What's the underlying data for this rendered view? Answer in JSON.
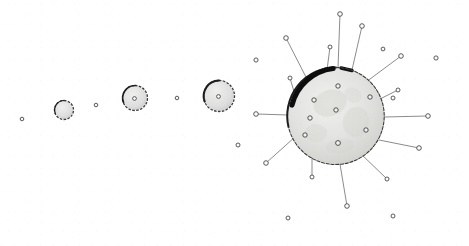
{
  "figure": {
    "background_color": "#ffffff",
    "width": 469,
    "height": 246,
    "ink_color": "#3a3a3a",
    "limb_shadow_color": "#121212",
    "body_fill_color": "#e4e4e2",
    "mare_color": "#cfcfcb",
    "callout_line_color": "#6e6e6e",
    "marker_stroke_color": "#4a4a4a"
  },
  "spheres": [
    {
      "name": "sphere-1",
      "cx": 64,
      "cy": 110,
      "r": 9.5,
      "outline_weight": 1.3,
      "label": "stage 1"
    },
    {
      "name": "sphere-2",
      "cx": 135,
      "cy": 98,
      "r": 12.5,
      "outline_weight": 1.3,
      "label": "stage 2"
    },
    {
      "name": "sphere-3",
      "cx": 219,
      "cy": 96,
      "r": 15.5,
      "outline_weight": 1.3,
      "label": "stage 3"
    },
    {
      "name": "sphere-4",
      "cx": 336,
      "cy": 116,
      "r": 49,
      "outline_weight": 1.6,
      "label": "stage 4"
    }
  ],
  "field_dots": [
    {
      "name": "field-dot-1",
      "cx": 22,
      "cy": 119,
      "r": 1.8
    },
    {
      "name": "field-dot-2",
      "cx": 96,
      "cy": 105,
      "r": 1.8
    },
    {
      "name": "field-dot-3",
      "cx": 177,
      "cy": 98,
      "r": 1.8
    }
  ],
  "surface_markers": [
    {
      "name": "surface-marker-1",
      "cx": 338,
      "cy": 86,
      "r": 2.2
    },
    {
      "name": "surface-marker-2",
      "cx": 370,
      "cy": 97,
      "r": 2.2
    },
    {
      "name": "surface-marker-3",
      "cx": 314,
      "cy": 100,
      "r": 2.2
    },
    {
      "name": "surface-marker-4",
      "cx": 336,
      "cy": 110,
      "r": 2.2
    },
    {
      "name": "surface-marker-5",
      "cx": 310,
      "cy": 118,
      "r": 2.2
    },
    {
      "name": "surface-marker-6",
      "cx": 366,
      "cy": 130,
      "r": 2.2
    },
    {
      "name": "surface-marker-7",
      "cx": 305,
      "cy": 135,
      "r": 2.2
    },
    {
      "name": "surface-marker-8",
      "cx": 338,
      "cy": 143,
      "r": 2.4
    }
  ],
  "callouts": [
    {
      "name": "callout-n",
      "x1": 338,
      "y1": 68,
      "x2": 340,
      "y2": 14,
      "mr": 2.3
    },
    {
      "name": "callout-nne",
      "x1": 352,
      "y1": 70,
      "x2": 362,
      "y2": 26,
      "mr": 2.3
    },
    {
      "name": "callout-nnw",
      "x1": 327,
      "y1": 70,
      "x2": 330,
      "y2": 47,
      "mr": 2.0
    },
    {
      "name": "callout-nw",
      "x1": 308,
      "y1": 81,
      "x2": 286,
      "y2": 38,
      "mr": 2.3
    },
    {
      "name": "callout-wnw",
      "x1": 295,
      "y1": 95,
      "x2": 290,
      "y2": 78,
      "mr": 2.0
    },
    {
      "name": "callout-w",
      "x1": 288,
      "y1": 115,
      "x2": 256,
      "y2": 114,
      "mr": 2.3
    },
    {
      "name": "callout-wsw",
      "x1": 295,
      "y1": 137,
      "x2": 266,
      "y2": 163,
      "mr": 2.3
    },
    {
      "name": "callout-sw",
      "x1": 312,
      "y1": 152,
      "x2": 312,
      "y2": 177,
      "mr": 2.0
    },
    {
      "name": "callout-s",
      "x1": 340,
      "y1": 164,
      "x2": 347,
      "y2": 206,
      "mr": 2.3
    },
    {
      "name": "callout-sse",
      "x1": 360,
      "y1": 153,
      "x2": 387,
      "y2": 179,
      "mr": 2.0
    },
    {
      "name": "callout-ese",
      "x1": 379,
      "y1": 140,
      "x2": 419,
      "y2": 148,
      "mr": 2.3
    },
    {
      "name": "callout-e",
      "x1": 384,
      "y1": 117,
      "x2": 428,
      "y2": 116,
      "mr": 2.3
    },
    {
      "name": "callout-ene",
      "x1": 378,
      "y1": 100,
      "x2": 398,
      "y2": 90,
      "mr": 2.0
    },
    {
      "name": "callout-ne",
      "x1": 366,
      "y1": 82,
      "x2": 401,
      "y2": 56,
      "mr": 2.3
    }
  ],
  "outer_dots": [
    {
      "name": "outer-dot-ne-far",
      "cx": 436,
      "cy": 58,
      "r": 2.1
    },
    {
      "name": "outer-dot-e-far",
      "cx": 383,
      "cy": 49,
      "r": 1.9
    },
    {
      "name": "outer-dot-nw-far",
      "cx": 256,
      "cy": 60,
      "r": 2.1
    },
    {
      "name": "outer-dot-w-mid",
      "cx": 238,
      "cy": 145,
      "r": 2.0
    },
    {
      "name": "outer-dot-s-left",
      "cx": 288,
      "cy": 218,
      "r": 2.0
    },
    {
      "name": "outer-dot-s-right",
      "cx": 393,
      "cy": 216,
      "r": 2.0
    },
    {
      "name": "outer-dot-e-mid",
      "cx": 393,
      "cy": 98,
      "r": 2.0
    }
  ],
  "mare_patches": [
    {
      "name": "mare-patch-1",
      "cx": 330,
      "cy": 103,
      "rx": 17,
      "ry": 13,
      "rot": -20,
      "op": 0.42
    },
    {
      "name": "mare-patch-2",
      "cx": 356,
      "cy": 122,
      "rx": 13,
      "ry": 15,
      "rot": 15,
      "op": 0.36
    },
    {
      "name": "mare-patch-3",
      "cx": 316,
      "cy": 133,
      "rx": 11,
      "ry": 9,
      "rot": 0,
      "op": 0.3
    },
    {
      "name": "mare-patch-4",
      "cx": 353,
      "cy": 95,
      "rx": 9,
      "ry": 7,
      "rot": 30,
      "op": 0.28
    },
    {
      "name": "mare-patch-5",
      "cx": 340,
      "cy": 146,
      "rx": 14,
      "ry": 7,
      "rot": -8,
      "op": 0.26
    }
  ]
}
